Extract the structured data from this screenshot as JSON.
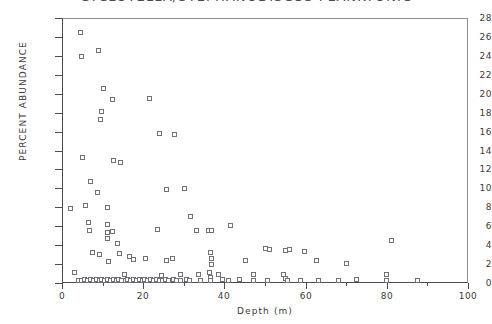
{
  "chart_data": {
    "type": "scatter",
    "title": "CYCLOTELLA/STEPHANODISCUS PLANKTONIC",
    "xlabel": "Depth (m)",
    "ylabel": "PERCENT ABUNDANCE",
    "xlim": [
      0,
      100
    ],
    "ylim": [
      0,
      28
    ],
    "xticks": [
      0,
      20,
      40,
      60,
      80,
      100
    ],
    "xtick_labels": [
      "0",
      "20",
      "40",
      "60",
      "80",
      "100"
    ],
    "x_minor_ticks": [
      10,
      30,
      50,
      70,
      90
    ],
    "yticks": [
      0,
      2,
      4,
      6,
      8,
      10,
      12,
      14,
      16,
      18,
      20,
      22,
      24,
      26,
      28
    ],
    "ytick_labels": [
      "0",
      "2",
      "4",
      "6",
      "8",
      "10",
      "12",
      "14",
      "16",
      "18",
      "20",
      "22",
      "24",
      "26",
      "28"
    ],
    "grid": false,
    "legend": null,
    "marker": "open-square",
    "marker_color": "#70707a",
    "axis_color": "#4d4d4d",
    "points": [
      [
        4.5,
        26.5
      ],
      [
        4.6,
        24.0
      ],
      [
        8.8,
        24.6
      ],
      [
        10.2,
        20.6
      ],
      [
        12.3,
        19.4
      ],
      [
        21.5,
        19.5
      ],
      [
        9.6,
        18.2
      ],
      [
        9.3,
        17.3
      ],
      [
        24.0,
        15.8
      ],
      [
        27.5,
        15.7
      ],
      [
        12.6,
        13.0
      ],
      [
        14.2,
        12.8
      ],
      [
        5.0,
        13.3
      ],
      [
        7.0,
        10.8
      ],
      [
        8.5,
        9.6
      ],
      [
        25.5,
        9.9
      ],
      [
        30.0,
        10.0
      ],
      [
        5.6,
        8.2
      ],
      [
        11.2,
        8.0
      ],
      [
        2.0,
        7.9
      ],
      [
        6.5,
        6.4
      ],
      [
        6.6,
        5.6
      ],
      [
        11.0,
        6.2
      ],
      [
        11.1,
        5.4
      ],
      [
        11.2,
        4.8
      ],
      [
        12.3,
        5.5
      ],
      [
        23.5,
        5.7
      ],
      [
        33.0,
        5.6
      ],
      [
        36.0,
        5.6
      ],
      [
        36.8,
        5.6
      ],
      [
        41.5,
        6.1
      ],
      [
        7.5,
        3.3
      ],
      [
        9.2,
        3.1
      ],
      [
        11.3,
        2.3
      ],
      [
        13.5,
        4.2
      ],
      [
        14.0,
        3.2
      ],
      [
        16.5,
        2.9
      ],
      [
        17.6,
        2.5
      ],
      [
        20.5,
        2.6
      ],
      [
        25.5,
        2.4
      ],
      [
        27.0,
        2.6
      ],
      [
        31.5,
        7.1
      ],
      [
        36.5,
        3.3
      ],
      [
        36.6,
        2.6
      ],
      [
        36.7,
        2.0
      ],
      [
        45.0,
        2.4
      ],
      [
        50.0,
        3.7
      ],
      [
        51.0,
        3.6
      ],
      [
        55.0,
        3.5
      ],
      [
        56.0,
        3.6
      ],
      [
        59.5,
        3.4
      ],
      [
        62.5,
        2.4
      ],
      [
        70.0,
        2.1
      ],
      [
        81.0,
        4.5
      ],
      [
        3.0,
        1.2
      ],
      [
        4.0,
        0.3
      ],
      [
        4.8,
        0.3
      ],
      [
        5.5,
        0.4
      ],
      [
        6.2,
        0.3
      ],
      [
        6.9,
        0.4
      ],
      [
        7.6,
        0.3
      ],
      [
        8.3,
        0.4
      ],
      [
        9.0,
        0.3
      ],
      [
        9.7,
        0.4
      ],
      [
        10.4,
        0.3
      ],
      [
        11.1,
        0.4
      ],
      [
        11.8,
        0.3
      ],
      [
        12.5,
        0.4
      ],
      [
        13.2,
        0.3
      ],
      [
        13.9,
        0.4
      ],
      [
        14.6,
        0.3
      ],
      [
        15.3,
        0.9
      ],
      [
        15.4,
        0.3
      ],
      [
        16.1,
        0.4
      ],
      [
        16.8,
        0.3
      ],
      [
        17.5,
        0.4
      ],
      [
        18.2,
        0.3
      ],
      [
        18.9,
        0.4
      ],
      [
        19.6,
        0.3
      ],
      [
        20.3,
        0.4
      ],
      [
        21.0,
        0.3
      ],
      [
        21.7,
        0.4
      ],
      [
        22.4,
        0.3
      ],
      [
        23.1,
        0.4
      ],
      [
        23.8,
        0.3
      ],
      [
        24.5,
        0.8
      ],
      [
        24.6,
        0.3
      ],
      [
        25.3,
        0.4
      ],
      [
        26.0,
        0.3
      ],
      [
        27.4,
        0.4
      ],
      [
        28.1,
        0.3
      ],
      [
        29.0,
        0.9
      ],
      [
        29.1,
        0.3
      ],
      [
        30.5,
        0.4
      ],
      [
        31.2,
        0.3
      ],
      [
        33.5,
        0.9
      ],
      [
        34.0,
        0.3
      ],
      [
        36.3,
        1.2
      ],
      [
        36.4,
        0.6
      ],
      [
        36.5,
        0.3
      ],
      [
        38.5,
        1.0
      ],
      [
        39.5,
        0.4
      ],
      [
        41.0,
        0.3
      ],
      [
        43.5,
        0.4
      ],
      [
        47.0,
        0.9
      ],
      [
        47.1,
        0.3
      ],
      [
        50.5,
        0.3
      ],
      [
        54.5,
        1.0
      ],
      [
        55.0,
        0.5
      ],
      [
        55.5,
        0.3
      ],
      [
        58.5,
        0.3
      ],
      [
        63.0,
        0.3
      ],
      [
        68.0,
        0.3
      ],
      [
        72.5,
        0.4
      ],
      [
        79.8,
        0.9
      ],
      [
        79.9,
        0.3
      ],
      [
        87.5,
        0.3
      ]
    ]
  }
}
